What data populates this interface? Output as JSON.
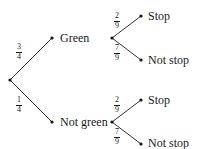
{
  "diagram": {
    "type": "probability-tree",
    "root": {
      "branches": [
        {
          "label": "Green",
          "probability": {
            "num": "3",
            "den": "4"
          },
          "branches": [
            {
              "label": "Stop",
              "probability": {
                "num": "2",
                "den": "9"
              }
            },
            {
              "label": "Not stop",
              "probability": {
                "num": "7",
                "den": "9"
              }
            }
          ]
        },
        {
          "label": "Not green",
          "probability": {
            "num": "1",
            "den": "4"
          },
          "branches": [
            {
              "label": "Stop",
              "probability": {
                "num": "2",
                "den": "9"
              }
            },
            {
              "label": "Not stop",
              "probability": {
                "num": "7",
                "den": "9"
              }
            }
          ]
        }
      ]
    },
    "colors": {
      "line": "#333333",
      "text": "#1a1a1a"
    }
  }
}
